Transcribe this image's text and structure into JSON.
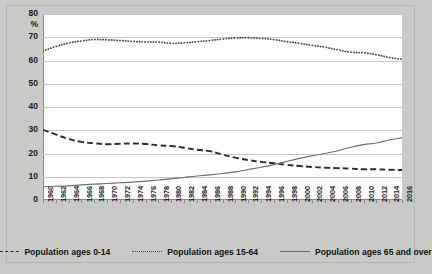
{
  "chart_data": {
    "type": "line",
    "title": "",
    "subtitle": "",
    "xlabel": "",
    "ylabel": "%",
    "ylim": [
      0,
      80
    ],
    "ytick_step": 10,
    "yticks": [
      0,
      10,
      20,
      30,
      40,
      50,
      60,
      70,
      80
    ],
    "grid": true,
    "legend_position": "bottom",
    "xlim": [
      1960,
      2016
    ],
    "x": [
      1960,
      1962,
      1964,
      1966,
      1968,
      1970,
      1972,
      1974,
      1976,
      1978,
      1980,
      1982,
      1984,
      1986,
      1988,
      1990,
      1992,
      1994,
      1996,
      1998,
      2000,
      2002,
      2004,
      2006,
      2008,
      2010,
      2012,
      2014,
      2016
    ],
    "categories": [
      "1960",
      "1962",
      "1964",
      "1966",
      "1968",
      "1970",
      "1972",
      "1974",
      "1976",
      "1978",
      "1980",
      "1982",
      "1984",
      "1986",
      "1988",
      "1990",
      "1992",
      "1994",
      "1996",
      "1998",
      "2000",
      "2002",
      "2004",
      "2006",
      "2008",
      "2010",
      "2012",
      "2014",
      "2016"
    ],
    "series": [
      {
        "name": "Population ages 0-14",
        "style": "dashed",
        "color": "#2b2b2b",
        "values": [
          30.2,
          28.2,
          26.2,
          25.0,
          24.4,
          24.0,
          24.2,
          24.3,
          24.1,
          23.5,
          23.2,
          22.5,
          21.6,
          21.0,
          19.5,
          18.2,
          17.2,
          16.4,
          15.8,
          15.1,
          14.6,
          14.2,
          13.9,
          13.7,
          13.5,
          13.2,
          13.2,
          13.0,
          12.9
        ]
      },
      {
        "name": "Population ages 15-64",
        "style": "dotted",
        "color": "#4a4a4a",
        "values": [
          64.1,
          66.0,
          67.5,
          68.4,
          69.0,
          68.9,
          68.6,
          68.2,
          68.0,
          67.9,
          67.4,
          67.6,
          68.1,
          68.6,
          69.2,
          69.7,
          69.8,
          69.5,
          69.0,
          68.1,
          67.4,
          66.5,
          65.7,
          64.6,
          63.6,
          63.3,
          62.5,
          61.3,
          60.5
        ]
      },
      {
        "name": "Population ages 65 and over",
        "style": "solid",
        "color": "#6e6e6e",
        "values": [
          5.7,
          5.9,
          6.1,
          6.5,
          6.8,
          7.1,
          7.4,
          7.7,
          8.1,
          8.6,
          9.1,
          9.7,
          10.3,
          10.8,
          11.4,
          12.1,
          13.1,
          14.1,
          15.2,
          16.6,
          17.9,
          19.0,
          20.0,
          21.2,
          22.7,
          23.8,
          24.5,
          25.8,
          26.8
        ]
      }
    ]
  },
  "axis": {
    "y_unit": "%",
    "y_labels": [
      "80",
      "70",
      "60",
      "50",
      "40",
      "30",
      "20",
      "10",
      "0"
    ]
  },
  "legend": {
    "items": [
      {
        "label": "Population ages 0-14",
        "style": "dashed",
        "icon": "dashed-line-icon"
      },
      {
        "label": "Population ages 15-64",
        "style": "dotted",
        "icon": "dotted-line-icon"
      },
      {
        "label": "Population ages 65 and over",
        "style": "solid",
        "icon": "solid-line-icon"
      }
    ]
  },
  "colors": {
    "background": "#c9c9c7",
    "plot_background": "#ffffff",
    "gridline": "#c4c4c4",
    "axis": "#8a8a8a",
    "series_0_14": "#2b2b2b",
    "series_15_64": "#4a4a4a",
    "series_65_over": "#6e6e6e"
  }
}
